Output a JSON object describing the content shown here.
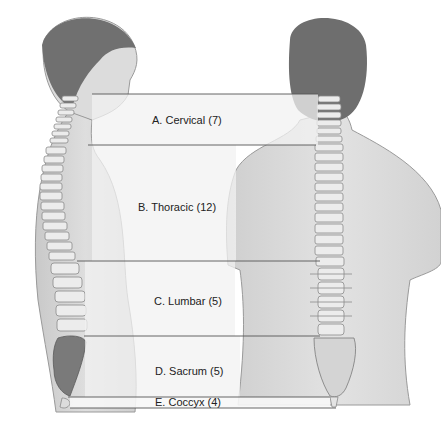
{
  "diagram": {
    "views": [
      "lateral view",
      "posterior view"
    ],
    "regions": [
      {
        "letter": "A",
        "name": "Cervical",
        "count": 7,
        "label": "A. Cervical (7)",
        "top": 94,
        "bottom": 145
      },
      {
        "letter": "B",
        "name": "Thoracic",
        "count": 12,
        "label": "B. Thoracic (12)",
        "top": 145,
        "bottom": 261
      },
      {
        "letter": "C",
        "name": "Lumbar",
        "count": 5,
        "label": "C. Lumbar (5)",
        "top": 261,
        "bottom": 336
      },
      {
        "letter": "D",
        "name": "Sacrum",
        "count": 5,
        "label": "D. Sacrum (5)",
        "top": 336,
        "bottom": 397
      },
      {
        "letter": "E",
        "name": "Coccyx",
        "count": 4,
        "label": "E. Coccyx (4)",
        "top": 397,
        "bottom": 408
      }
    ],
    "colors": {
      "skin": "#d8d8d8",
      "skin_shadow": "#bdbdbd",
      "hair": "#6e6e6e",
      "bone": "#ececec",
      "bone_outline": "#8a8a8a",
      "band": "#f2f2f2",
      "line": "#555555"
    }
  }
}
